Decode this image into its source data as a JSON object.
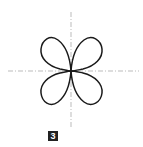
{
  "figure": {
    "label": "3",
    "curve": "four-petal polar curve (quadrifolium)",
    "colors": {
      "curve": "#1a1a1a",
      "axes": "#aaaaaa",
      "label_bg": "#222222",
      "label_fg": "#ffffff"
    }
  }
}
